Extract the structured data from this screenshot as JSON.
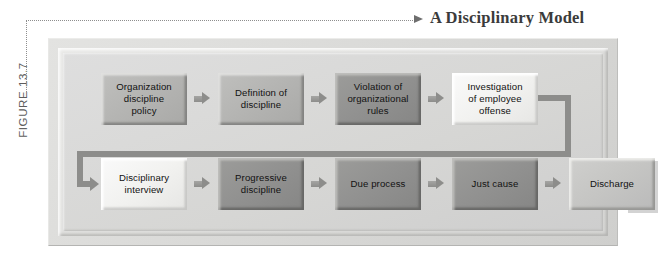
{
  "figure": {
    "label": "FIGURE 13.7",
    "title": "A Disciplinary Model"
  },
  "colors": {
    "page_background": "#ffffff",
    "panel_background": "#d8d8d6",
    "box_mid_gray": "#b4b4b2",
    "box_dark_gray": "#919190",
    "box_light_gray": "#f2f2f0",
    "box_light_mid_gray": "#c5c5c3",
    "arrow_gray": "#8d8d8b",
    "text_dark": "#121212",
    "title_text": "#3b3b3b",
    "label_text": "#5d5d5d",
    "leader_dotted": "#8e8e8e"
  },
  "diagram": {
    "type": "flowchart",
    "orientation": "two-row serpentine (left-to-right, then wrap to second row)",
    "top_row": [
      {
        "id": "organization-discipline-policy",
        "label": "Organization discipline policy",
        "lines": [
          "Organization",
          "discipline",
          "policy"
        ],
        "tone": "mid"
      },
      {
        "id": "definition-of-discipline",
        "label": "Definition of discipline",
        "lines": [
          "Definition of",
          "discipline"
        ],
        "tone": "mid"
      },
      {
        "id": "violation-of-organizational-rules",
        "label": "Violation of organizational rules",
        "lines": [
          "Violation of",
          "organizational",
          "rules"
        ],
        "tone": "dark"
      },
      {
        "id": "investigation-of-employee-offense",
        "label": "Investigation of employee offense",
        "lines": [
          "Investigation",
          "of employee",
          "offense"
        ],
        "tone": "light"
      }
    ],
    "bottom_row": [
      {
        "id": "disciplinary-interview",
        "label": "Disciplinary interview",
        "lines": [
          "Disciplinary",
          "interview"
        ],
        "tone": "light"
      },
      {
        "id": "progressive-discipline",
        "label": "Progressive discipline",
        "lines": [
          "Progressive",
          "discipline"
        ],
        "tone": "dark"
      },
      {
        "id": "due-process",
        "label": "Due process",
        "lines": [
          "Due process"
        ],
        "tone": "dark"
      },
      {
        "id": "just-cause",
        "label": "Just cause",
        "lines": [
          "Just cause"
        ],
        "tone": "dark"
      },
      {
        "id": "discharge",
        "label": "Discharge",
        "lines": [
          "Discharge"
        ],
        "tone": "lightmid"
      }
    ],
    "connectors": {
      "inline_arrow_icon": "arrow-right-icon",
      "wrap_connector_icon": "elbow-connector-icon",
      "wrap_description": "Investigation of employee offense wraps down and back to Disciplinary interview"
    }
  }
}
